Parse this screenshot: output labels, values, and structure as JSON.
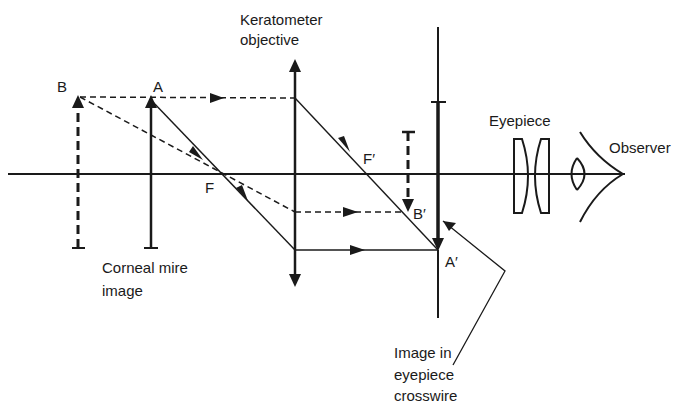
{
  "diagram": {
    "colors": {
      "ink": "#1a1a1a",
      "background": "#ffffff"
    },
    "labels": {
      "point_b": "B",
      "point_a": "A",
      "focus_f": "F",
      "focus_f_prime": "F′",
      "image_b_prime": "B′",
      "image_a_prime": "A′",
      "keratometer_objective_line1": "Keratometer",
      "keratometer_objective_line2": "objective",
      "eyepiece": "Eyepiece",
      "observer": "Observer",
      "corneal_mire_line1": "Corneal mire",
      "corneal_mire_line2": "image",
      "crosswire_line1": "Image in",
      "crosswire_line2": "eyepiece",
      "crosswire_line3": "crosswire"
    },
    "elements": [
      "optical-axis",
      "object-b-dashed-arrow",
      "object-a-solid-arrow",
      "keratometer-objective-lens",
      "eyepiece-crosswire",
      "image-b-prime-dashed-arrow",
      "image-a-prime-arrow",
      "eyepiece-lenses",
      "observer-eye",
      "ray-paths"
    ]
  }
}
